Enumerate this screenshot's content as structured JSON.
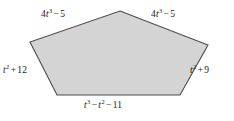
{
  "figure": {
    "kind": "pentagon-diagram",
    "colors": {
      "background": "#ffffff",
      "shape_fill": "#d4d4d4",
      "shape_stroke": "#4d4d4d",
      "label_text": "#1a1a1a"
    },
    "shape": {
      "name": "pentagon",
      "points": "120,11 208,45 180,95 57,95 30,42"
    },
    "sides": [
      {
        "id": "top-left",
        "position": "upper-left-edge",
        "text": "4t^3 - 5",
        "coefficient": "4",
        "variable": "t",
        "exponent": "3",
        "operator": "−",
        "constant": "5"
      },
      {
        "id": "top-right",
        "position": "upper-right-edge",
        "text": "4t^3 - 5",
        "coefficient": "4",
        "variable": "t",
        "exponent": "3",
        "operator": "−",
        "constant": "5"
      },
      {
        "id": "left",
        "position": "left-edge",
        "text": "t^2 + 12",
        "variable": "t",
        "exponent": "2",
        "operator": "+",
        "constant": "12"
      },
      {
        "id": "right",
        "position": "right-edge",
        "text": "t^2 + 9",
        "variable": "t",
        "exponent": "2",
        "operator": "+",
        "constant": "9"
      },
      {
        "id": "bottom",
        "position": "bottom-edge",
        "text": "t^3 - t^2 - 11",
        "variable": "t",
        "exponent_first": "3",
        "operator_first": "−",
        "exponent_second": "2",
        "operator_second": "−",
        "constant": "11"
      }
    ]
  }
}
